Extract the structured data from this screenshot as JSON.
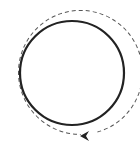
{
  "diagram": {
    "inner_circle": {
      "cx": 72,
      "cy": 73,
      "r": 52,
      "stroke": "#222222",
      "stroke_width": 2.2
    },
    "outer_path": {
      "cx": 72,
      "cy": 73,
      "r": 62,
      "stroke": "#555555",
      "dash": "4 3"
    },
    "arrow": {
      "direction": "counterclockwise",
      "tip_x": 80,
      "tip_y": 135,
      "color": "#222222"
    },
    "icons": [
      "rotation-arrow-icon"
    ]
  }
}
